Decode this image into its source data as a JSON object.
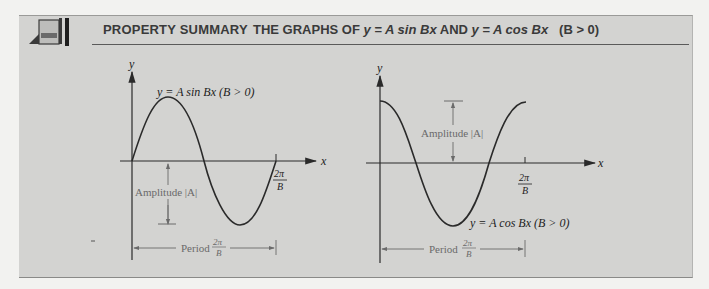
{
  "header": {
    "section_label": "PROPERTY SUMMARY",
    "title_prefix": "THE GRAPHS OF ",
    "title_eq1": "y = A sin Bx",
    "title_and": " AND ",
    "title_eq2": "y = A cos Bx",
    "title_condition": "(B > 0)"
  },
  "sine_graph": {
    "y_axis_label": "y",
    "x_axis_label": "x",
    "curve_label": "y = A sin Bx (B > 0)",
    "amplitude_label": "Amplitude |A|",
    "period_label": "Period",
    "period_frac_num": "2π",
    "period_frac_den": "B",
    "tick_num": "2π",
    "tick_den": "B"
  },
  "cosine_graph": {
    "y_axis_label": "y",
    "x_axis_label": "x",
    "curve_label": "y = A cos Bx (B > 0)",
    "amplitude_label": "Amplitude |A|",
    "period_label": "Period",
    "period_frac_num": "2π",
    "period_frac_den": "B",
    "tick_num": "2π",
    "tick_den": "B"
  },
  "colors": {
    "panel_bg": "#d3d3d1",
    "curve": "#2a2a2a",
    "annotation": "#6a6a6a"
  }
}
